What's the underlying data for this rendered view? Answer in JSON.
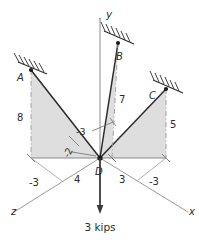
{
  "figure": {
    "axes": {
      "y_label": "y",
      "x_label": "x",
      "z_label": "z"
    },
    "origin_label": "D",
    "nodes": [
      {
        "id": "A",
        "label": "A",
        "support": "hatched-wall-anchor"
      },
      {
        "id": "B",
        "label": "B",
        "support": "hatched-wall-anchor"
      },
      {
        "id": "C",
        "label": "C",
        "support": "hatched-wall-anchor"
      },
      {
        "id": "D",
        "label": "D",
        "support": "free-joint"
      }
    ],
    "dimensions": [
      {
        "id": "dim-A-height",
        "value": "8"
      },
      {
        "id": "dim-B-height",
        "value": "7"
      },
      {
        "id": "dim-C-height",
        "value": "5"
      },
      {
        "id": "dim-z-neg-left",
        "value": "-3"
      },
      {
        "id": "dim-z-run",
        "value": "4"
      },
      {
        "id": "dim-x-run",
        "value": "3"
      },
      {
        "id": "dim-x-neg-right",
        "value": "-3"
      },
      {
        "id": "dim-center-upper",
        "value": "-3"
      },
      {
        "id": "dim-center-lower",
        "value": "-2"
      }
    ],
    "load": {
      "label": "3 kips",
      "direction": "downward"
    },
    "colors": {
      "line": "#2b2b2b",
      "axis": "#8d8d8d",
      "shade": "#dedede",
      "dashed": "#9a9a9a",
      "text": "#2b2b2b"
    }
  }
}
